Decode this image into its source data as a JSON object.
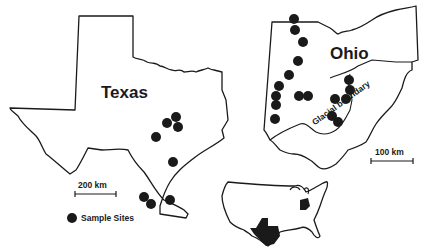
{
  "states": {
    "texas": {
      "label": "Texas"
    },
    "ohio": {
      "label": "Ohio"
    }
  },
  "annotations": {
    "glacial_boundary": "Glacial boundary"
  },
  "scale_bars": {
    "texas": "200 km",
    "ohio": "100 km"
  },
  "legend": {
    "sample_sites": "Sample Sites"
  },
  "colors": {
    "ink": "#1a1a1a",
    "background": "#ffffff"
  }
}
